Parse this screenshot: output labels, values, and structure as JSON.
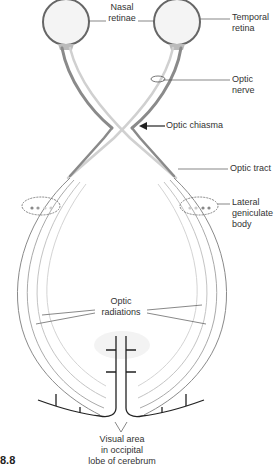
{
  "figure": {
    "number": "8.8"
  },
  "labels": {
    "nasal_retinae": [
      "Nasal",
      "retinae"
    ],
    "temporal_retina": [
      "Temporal",
      "retina"
    ],
    "optic_nerve": "Optic nerve",
    "optic_chiasma": "Optic chiasma",
    "optic_tract": "Optic tract",
    "lateral_geniculate_body": [
      "Lateral",
      "geniculate",
      "body"
    ],
    "optic_radiations": [
      "Optic",
      "radiations"
    ],
    "visual_area": [
      "Visual area",
      "in occipital",
      "lobe of cerebrum"
    ]
  },
  "colors": {
    "outline": "#555555",
    "nerve_dark": "#8a8a8a",
    "nerve_light": "#cfcfcf",
    "cortex": "#222222",
    "leader": "#555555"
  }
}
